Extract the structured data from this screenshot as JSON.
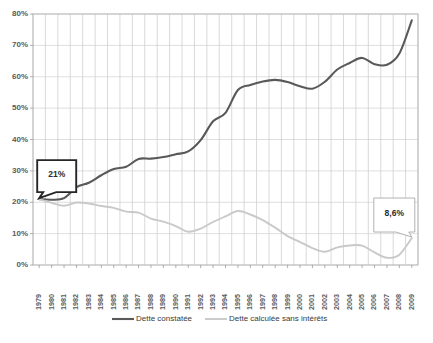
{
  "chart_data": {
    "type": "line",
    "title": "",
    "xlabel": "",
    "ylabel": "",
    "ylim": [
      0,
      80
    ],
    "ytick_labels": [
      "0%",
      "10%",
      "20%",
      "30%",
      "40%",
      "50%",
      "60%",
      "70%",
      "80%"
    ],
    "ytick_values": [
      0,
      10,
      20,
      30,
      40,
      50,
      60,
      70,
      80
    ],
    "grid": true,
    "legend_position": "bottom",
    "categories": [
      "1979",
      "1980",
      "1981",
      "1982",
      "1983",
      "1984",
      "1985",
      "1986",
      "1987",
      "1988",
      "1989",
      "1990",
      "1991",
      "1992",
      "1993",
      "1994",
      "1995",
      "1996",
      "1997",
      "1998",
      "1999",
      "2000",
      "2001",
      "2002",
      "2003",
      "2004",
      "2005",
      "2006",
      "2007",
      "2008",
      "2009"
    ],
    "series": [
      {
        "name": "Dette constatée",
        "color": "#595959",
        "width": 2.1,
        "values": [
          21,
          20.8,
          21.3,
          24.8,
          26.2,
          28.6,
          30.6,
          31.3,
          33.8,
          33.9,
          34.4,
          35.3,
          36.2,
          39.8,
          45.8,
          48.5,
          55.8,
          57.4,
          58.5,
          59.0,
          58.3,
          57.0,
          56.2,
          58.4,
          62.3,
          64.4,
          66.0,
          64.0,
          63.8,
          67.4,
          78.0
        ]
      },
      {
        "name": "Dette calculée sans intérêts",
        "color": "#c9c9c9",
        "width": 1.9,
        "values": [
          21,
          19.8,
          18.9,
          19.9,
          19.6,
          18.8,
          18.2,
          17.0,
          16.7,
          14.8,
          13.8,
          12.4,
          10.6,
          11.6,
          13.7,
          15.5,
          17.2,
          16.1,
          14.3,
          11.9,
          9.2,
          7.3,
          5.4,
          4.2,
          5.6,
          6.2,
          6.2,
          4.0,
          2.3,
          3.3,
          8.6
        ]
      }
    ],
    "annotations": [
      {
        "name": "start-value-callout",
        "label": "21%",
        "x_category": "1979",
        "value": 21,
        "style": "thick-dark-border"
      },
      {
        "name": "end-value-callout",
        "label": "8,6%",
        "x_category": "2009",
        "value": 8.6,
        "style": "thin-light-border"
      }
    ]
  },
  "legend": {
    "items": [
      {
        "label": "Dette constatée",
        "color": "#595959"
      },
      {
        "label": "Dette calculée sans intérêts",
        "color": "#c9c9c9"
      }
    ]
  }
}
